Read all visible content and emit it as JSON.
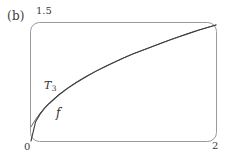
{
  "figure": {
    "panel_label": "(b)",
    "frame_color": "#9a9a9a",
    "curve_color_f": "#3d3d3d",
    "curve_color_T3": "#6b6b6b"
  },
  "chart_data": {
    "type": "line",
    "title": "",
    "subtitle": "",
    "xlabel": "",
    "ylabel": "",
    "xlim": [
      0,
      2
    ],
    "ylim": [
      0,
      1.5
    ],
    "xticks": [
      "0",
      "2"
    ],
    "yticks": [
      "1.5"
    ],
    "grid": false,
    "legend": "inline-annotation",
    "annotations": [
      {
        "name": "T3",
        "text": "T",
        "subscript": "3",
        "x": 0.28,
        "y": 0.72
      },
      {
        "name": "f",
        "text": "f",
        "subscript": "",
        "x": 0.38,
        "y": 0.4
      }
    ],
    "x": [
      0,
      0.05,
      0.1,
      0.15,
      0.2,
      0.3,
      0.4,
      0.5,
      0.6,
      0.7,
      0.8,
      0.9,
      1.0,
      1.1,
      1.2,
      1.3,
      1.4,
      1.5,
      1.6,
      1.7,
      1.8,
      1.9,
      2.0
    ],
    "series": [
      {
        "name": "f",
        "label": "f",
        "values": [
          0.0,
          0.245,
          0.345,
          0.42,
          0.48,
          0.585,
          0.672,
          0.75,
          0.82,
          0.885,
          0.945,
          1.0,
          1.055,
          1.105,
          1.15,
          1.195,
          1.24,
          1.283,
          1.325,
          1.365,
          1.405,
          1.44,
          1.475
        ]
      },
      {
        "name": "T3",
        "label": "T₃",
        "values": [
          0.18,
          0.275,
          0.355,
          0.425,
          0.485,
          0.59,
          0.678,
          0.755,
          0.824,
          0.888,
          0.947,
          1.002,
          1.056,
          1.106,
          1.151,
          1.196,
          1.241,
          1.284,
          1.326,
          1.366,
          1.406,
          1.441,
          1.476
        ]
      }
    ]
  }
}
